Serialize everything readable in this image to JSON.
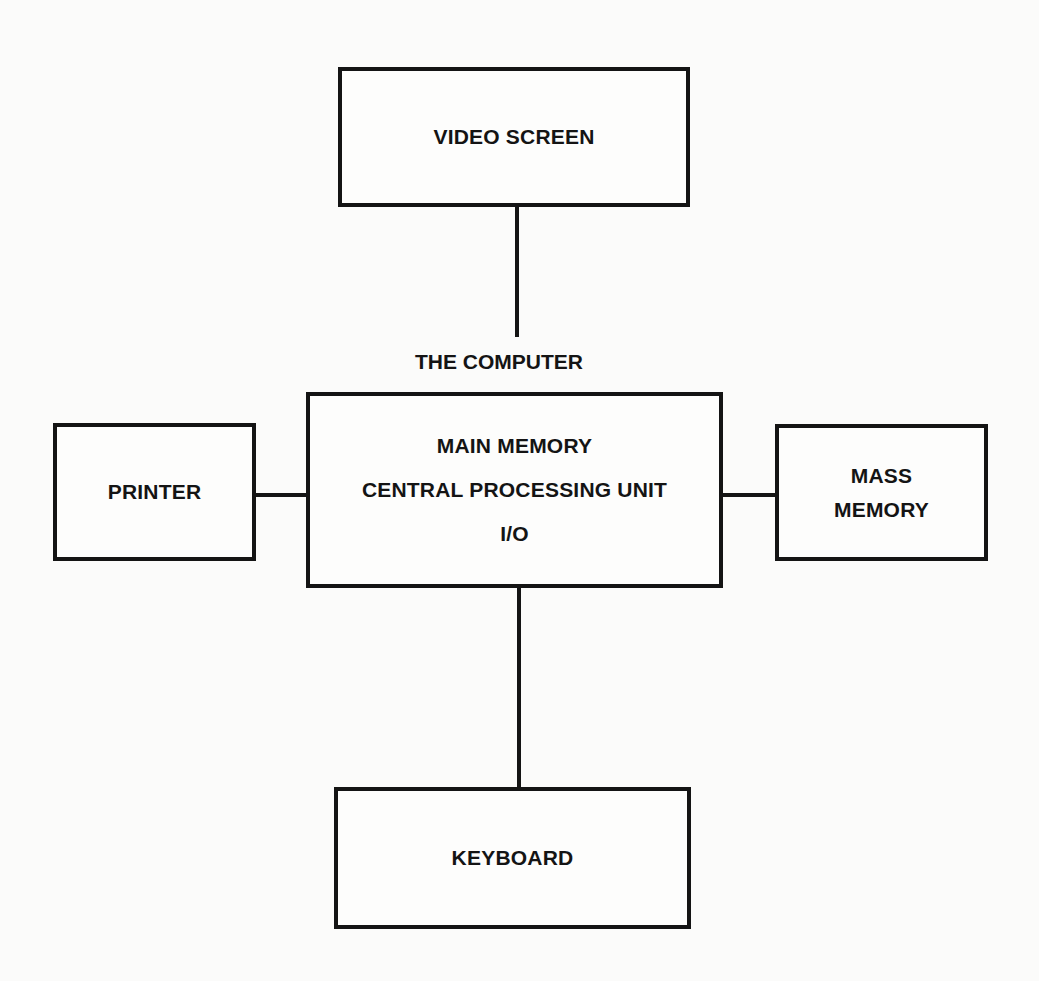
{
  "diagram": {
    "title": "THE COMPUTER",
    "nodes": {
      "video_screen": {
        "label": "VIDEO SCREEN"
      },
      "main": {
        "lines": [
          "MAIN MEMORY",
          "CENTRAL PROCESSING UNIT",
          "I/O"
        ]
      },
      "printer": {
        "label": "PRINTER"
      },
      "mass_memory": {
        "lines": [
          "MASS",
          "MEMORY"
        ]
      },
      "keyboard": {
        "label": "KEYBOARD"
      }
    },
    "edges": [
      {
        "from": "video_screen",
        "to": "main"
      },
      {
        "from": "printer",
        "to": "main"
      },
      {
        "from": "main",
        "to": "mass_memory"
      },
      {
        "from": "main",
        "to": "keyboard"
      }
    ]
  }
}
